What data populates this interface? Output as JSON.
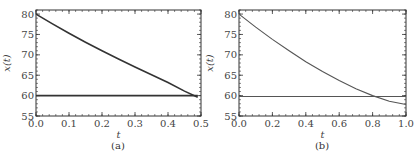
{
  "chart_data": [
    {
      "type": "line",
      "caption": "(a)",
      "xlabel": "t",
      "ylabel": "x(t)",
      "xlim": [
        0,
        0.5
      ],
      "ylim": [
        55,
        81
      ],
      "xticks": [
        0.0,
        0.1,
        0.2,
        0.3,
        0.4,
        0.5
      ],
      "xtick_labels": [
        "0.0",
        "0.1",
        "0.2",
        "0.3",
        "0.4",
        "0.5"
      ],
      "yticks": [
        55,
        60,
        65,
        70,
        75,
        80
      ],
      "ytick_labels": [
        "55",
        "60",
        "65",
        "70",
        "75",
        "80"
      ],
      "grid": false,
      "series": [
        {
          "name": "x(t)",
          "x": [
            0.0,
            0.05,
            0.1,
            0.15,
            0.2,
            0.25,
            0.3,
            0.35,
            0.4,
            0.45,
            0.49
          ],
          "y": [
            80.0,
            77.6,
            75.3,
            73.1,
            71.0,
            69.0,
            67.0,
            65.1,
            63.2,
            61.1,
            59.6
          ]
        },
        {
          "name": "threshold",
          "x": [
            0.0,
            0.49
          ],
          "y": [
            60.0,
            60.0
          ]
        }
      ]
    },
    {
      "type": "line",
      "caption": "(b)",
      "xlabel": "t",
      "ylabel": "x(t)",
      "xlim": [
        0,
        1
      ],
      "ylim": [
        55,
        81
      ],
      "xticks": [
        0.0,
        0.2,
        0.4,
        0.6,
        0.8,
        1.0
      ],
      "xtick_labels": [
        "0.0",
        "0.2",
        "0.4",
        "0.6",
        "0.8",
        "1.0"
      ],
      "yticks": [
        55,
        60,
        65,
        70,
        75,
        80
      ],
      "ytick_labels": [
        "55",
        "60",
        "65",
        "70",
        "75",
        "80"
      ],
      "grid": false,
      "series": [
        {
          "name": "x(t)",
          "x": [
            0.0,
            0.1,
            0.2,
            0.3,
            0.4,
            0.5,
            0.6,
            0.7,
            0.8,
            0.9,
            1.0
          ],
          "y": [
            80.0,
            76.8,
            73.8,
            71.0,
            68.3,
            65.9,
            63.7,
            61.7,
            60.0,
            58.6,
            57.8
          ]
        },
        {
          "name": "threshold",
          "x": [
            0.0,
            1.0
          ],
          "y": [
            59.8,
            59.8
          ]
        }
      ]
    }
  ]
}
